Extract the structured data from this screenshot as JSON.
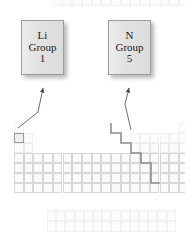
{
  "figure": {
    "kind": "periodic-table-callout-diagram"
  },
  "callouts": [
    {
      "id": "li",
      "symbol": "Li",
      "group_label": "Group",
      "group_number": "1",
      "box_fill": "#e3e3e3",
      "box_border": "#9d9d9d"
    },
    {
      "id": "n",
      "symbol": "N",
      "group_label": "Group",
      "group_number": "5",
      "box_fill": "#e3e3e3",
      "box_border": "#9d9d9d"
    }
  ],
  "table": {
    "highlighted_cells": [
      "Li"
    ],
    "divider": "metalloid-staircase",
    "grid_line_color": "#d8d8dc",
    "cell_fill": "#fafafb",
    "highlight_fill": "#eeeef0",
    "highlight_border": "#9a9a9f",
    "staircase_color": "#8d8d92"
  },
  "arrows": [
    {
      "id": "arrow-li",
      "from": "callout-li",
      "to": "li-cell",
      "color": "#6e6e73"
    },
    {
      "id": "arrow-n",
      "from": "callout-n",
      "to": "n-cell",
      "color": "#6e6e73"
    }
  ]
}
